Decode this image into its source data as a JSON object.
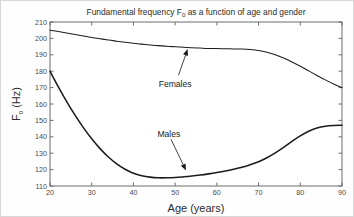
{
  "chart_data": {
    "type": "line",
    "title": "Fundamental frequency F0 as a function of age and gender",
    "title_prefix": "Fundamental frequency F",
    "title_subscript": "0",
    "title_suffix": " as a function of age and gender",
    "xlabel": "Age (years)",
    "ylabel": "F0 (Hz)",
    "ylabel_prefix": "F",
    "ylabel_subscript": "0",
    "ylabel_suffix": " (Hz)",
    "xlim": [
      20,
      90
    ],
    "ylim": [
      110,
      210
    ],
    "xticks": [
      20,
      30,
      40,
      50,
      60,
      70,
      80,
      90
    ],
    "yticks": [
      110,
      120,
      130,
      140,
      150,
      160,
      170,
      180,
      190,
      200,
      210
    ],
    "grid": false,
    "legend": "annotations",
    "tick_direction": "in",
    "box": true,
    "x": [
      20,
      22,
      24,
      26,
      28,
      30,
      32,
      34,
      36,
      38,
      40,
      42,
      44,
      46,
      48,
      50,
      52,
      54,
      56,
      58,
      60,
      62,
      64,
      66,
      68,
      70,
      72,
      74,
      76,
      78,
      80,
      82,
      84,
      86,
      88,
      90
    ],
    "series": [
      {
        "name": "Females",
        "color": "#1c1c1c",
        "values": [
          205.0,
          204.2,
          203.3,
          202.4,
          201.5,
          200.6,
          199.8,
          199.0,
          198.3,
          197.6,
          197.0,
          196.5,
          196.0,
          195.6,
          195.2,
          194.9,
          194.6,
          194.3,
          194.1,
          193.9,
          193.8,
          193.7,
          193.6,
          193.5,
          193.2,
          192.6,
          191.5,
          190.0,
          188.0,
          185.6,
          183.0,
          180.2,
          177.4,
          174.7,
          172.2,
          170.0
        ]
      },
      {
        "name": "Males",
        "color": "#1c1c1c",
        "values": [
          180.0,
          170.5,
          161.5,
          153.2,
          145.6,
          138.8,
          132.8,
          127.7,
          123.5,
          120.2,
          117.8,
          116.3,
          115.4,
          115.0,
          115.0,
          115.2,
          115.6,
          116.1,
          116.7,
          117.4,
          118.2,
          119.1,
          120.2,
          121.5,
          123.0,
          124.8,
          127.2,
          130.2,
          133.6,
          137.2,
          140.6,
          143.4,
          145.3,
          146.4,
          146.9,
          147.0
        ]
      }
    ],
    "annotations": [
      {
        "label": "Females",
        "text_x": 50.0,
        "text_y": 172.0,
        "arrow_from_x": 50.8,
        "arrow_from_y": 177.5,
        "arrow_to_x": 53.0,
        "arrow_to_y": 193.5
      },
      {
        "label": "Males",
        "text_x": 48.5,
        "text_y": 142.0,
        "arrow_from_x": 49.0,
        "arrow_from_y": 138.5,
        "arrow_to_x": 52.6,
        "arrow_to_y": 119.5
      }
    ]
  }
}
